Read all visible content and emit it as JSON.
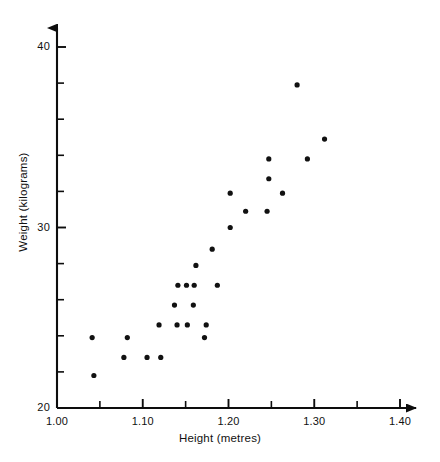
{
  "chart_data": {
    "type": "scatter",
    "title": "",
    "xlabel": "Height (metres)",
    "ylabel": "Weight (kilograms)",
    "xlim": [
      1.0,
      1.4
    ],
    "ylim": [
      20,
      40
    ],
    "grid": false,
    "legend": null,
    "x_ticks_major": [
      "1.00",
      "1.10",
      "1.20",
      "1.30",
      "1.40"
    ],
    "x_ticks_major_values": [
      1.0,
      1.1,
      1.2,
      1.3,
      1.4
    ],
    "x_ticks_minor_values": [
      1.05,
      1.15,
      1.25,
      1.35
    ],
    "y_ticks_major": [
      "20",
      "30",
      "40"
    ],
    "y_ticks_major_values": [
      20,
      30,
      40
    ],
    "y_ticks_minor_values": [
      22,
      24,
      26,
      28,
      32,
      34,
      36,
      38
    ],
    "series_name": "pupils",
    "point_color": "#111111",
    "point_radius": 2.6,
    "points": [
      {
        "x": 1.041,
        "y": 23.9
      },
      {
        "x": 1.043,
        "y": 21.8
      },
      {
        "x": 1.078,
        "y": 22.8
      },
      {
        "x": 1.082,
        "y": 23.9
      },
      {
        "x": 1.105,
        "y": 22.8
      },
      {
        "x": 1.119,
        "y": 24.6
      },
      {
        "x": 1.121,
        "y": 22.8
      },
      {
        "x": 1.137,
        "y": 25.7
      },
      {
        "x": 1.14,
        "y": 24.6
      },
      {
        "x": 1.141,
        "y": 26.8
      },
      {
        "x": 1.151,
        "y": 26.8
      },
      {
        "x": 1.152,
        "y": 24.6
      },
      {
        "x": 1.159,
        "y": 25.7
      },
      {
        "x": 1.16,
        "y": 26.8
      },
      {
        "x": 1.162,
        "y": 27.9
      },
      {
        "x": 1.172,
        "y": 23.9
      },
      {
        "x": 1.174,
        "y": 24.6
      },
      {
        "x": 1.181,
        "y": 28.8
      },
      {
        "x": 1.187,
        "y": 26.8
      },
      {
        "x": 1.202,
        "y": 30.0
      },
      {
        "x": 1.202,
        "y": 31.9
      },
      {
        "x": 1.22,
        "y": 30.9
      },
      {
        "x": 1.245,
        "y": 30.9
      },
      {
        "x": 1.247,
        "y": 32.7
      },
      {
        "x": 1.247,
        "y": 33.8
      },
      {
        "x": 1.263,
        "y": 31.9
      },
      {
        "x": 1.28,
        "y": 37.9
      },
      {
        "x": 1.292,
        "y": 33.8
      },
      {
        "x": 1.312,
        "y": 34.9
      }
    ]
  },
  "axes": {
    "x_title": "Height (metres)",
    "y_title": "Weight (kilograms)"
  }
}
